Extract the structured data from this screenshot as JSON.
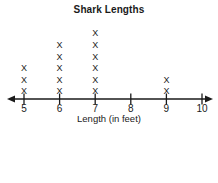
{
  "chart_data": {
    "type": "bar",
    "plot_style": "dot-plot",
    "title": "Shark Lengths",
    "xlabel": "Length (in feet)",
    "ylabel": "",
    "categories": [
      "5",
      "6",
      "7",
      "8",
      "9",
      "10"
    ],
    "values": [
      3,
      5,
      6,
      0,
      2,
      0
    ],
    "mark_glyph": "X",
    "total_marks": 16,
    "xlim": [
      5,
      10
    ],
    "tick_labels": [
      "5",
      "6",
      "7",
      "8",
      "9",
      "10"
    ],
    "grid": false,
    "legend": null,
    "axis_arrows": "both",
    "colors": {
      "ink": "#1a1a1a",
      "background": "#ffffff"
    }
  },
  "figure": {
    "title": "Shark Lengths",
    "axis_label": "Length (in feet)"
  }
}
